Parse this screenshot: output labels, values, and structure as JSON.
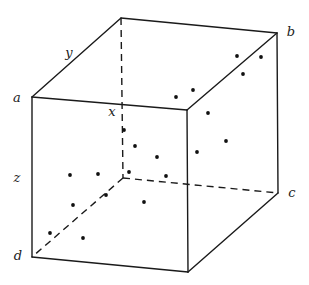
{
  "diagram": {
    "type": "3d-cube-scatter",
    "stroke_color": "#1a1a1a",
    "dot_color": "#111111",
    "vertices": {
      "a": [
        32,
        97
      ],
      "front_top_right": [
        187,
        110
      ],
      "front_bottom_right": [
        188,
        272
      ],
      "d": [
        32,
        257
      ],
      "back_top_left": [
        121,
        18
      ],
      "b": [
        277,
        33
      ],
      "c": [
        278,
        193
      ],
      "back_bottom_left": [
        123,
        178
      ]
    },
    "visible_edges": [
      [
        "a",
        "front_top_right"
      ],
      [
        "front_top_right",
        "front_bottom_right"
      ],
      [
        "front_bottom_right",
        "d"
      ],
      [
        "d",
        "a"
      ],
      [
        "a",
        "back_top_left"
      ],
      [
        "back_top_left",
        "b"
      ],
      [
        "b",
        "c"
      ],
      [
        "b",
        "front_top_right"
      ],
      [
        "c",
        "front_bottom_right"
      ]
    ],
    "hidden_edges": [
      [
        "back_top_left",
        "back_bottom_left"
      ],
      [
        "back_bottom_left",
        "c"
      ],
      [
        "back_bottom_left",
        "d"
      ]
    ],
    "labels": [
      {
        "id": "label-a",
        "text": "a",
        "x": 17,
        "y": 97
      },
      {
        "id": "label-b",
        "text": "b",
        "x": 291,
        "y": 31
      },
      {
        "id": "label-c",
        "text": "c",
        "x": 292,
        "y": 192
      },
      {
        "id": "label-d",
        "text": "d",
        "x": 18,
        "y": 255
      },
      {
        "id": "label-x",
        "text": "x",
        "x": 112,
        "y": 111
      },
      {
        "id": "label-y",
        "text": "y",
        "x": 69,
        "y": 52
      },
      {
        "id": "label-z",
        "text": "z",
        "x": 17,
        "y": 177
      }
    ],
    "points": [
      [
        237,
        56
      ],
      [
        261,
        57
      ],
      [
        243,
        74
      ],
      [
        193,
        90
      ],
      [
        176,
        97
      ],
      [
        208,
        113
      ],
      [
        124,
        130
      ],
      [
        226,
        141
      ],
      [
        135,
        146
      ],
      [
        197,
        152
      ],
      [
        157,
        157
      ],
      [
        129,
        172
      ],
      [
        70,
        175
      ],
      [
        98,
        174
      ],
      [
        166,
        176
      ],
      [
        106,
        195
      ],
      [
        144,
        202
      ],
      [
        73,
        205
      ],
      [
        50,
        233
      ],
      [
        83,
        238
      ]
    ]
  }
}
